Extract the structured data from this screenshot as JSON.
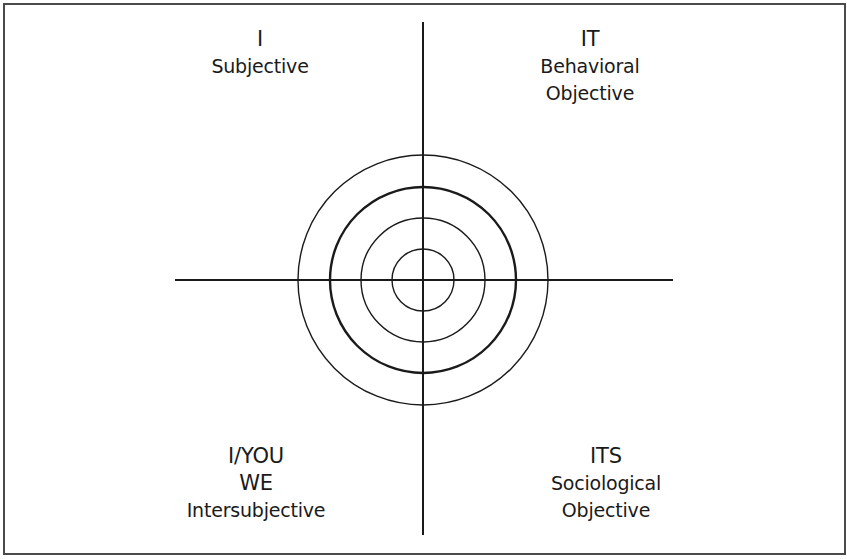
{
  "diagram": {
    "title": "",
    "quadrants": {
      "upper_left": {
        "head": "I",
        "lines": [
          "Subjective"
        ]
      },
      "upper_right": {
        "head": "IT",
        "lines": [
          "Behavioral",
          "Objective"
        ]
      },
      "lower_left": {
        "head": "I/YOU",
        "lines": [
          "WE",
          "Intersubjective"
        ]
      },
      "lower_right": {
        "head": "ITS",
        "lines": [
          "Sociological",
          "Objective"
        ]
      }
    },
    "center": {
      "x": 423,
      "y": 280
    },
    "circles": [
      {
        "r": 31,
        "stroke_width": 1.4
      },
      {
        "r": 62,
        "stroke_width": 1.4
      },
      {
        "r": 93,
        "stroke_width": 2.4
      },
      {
        "r": 125,
        "stroke_width": 1.4
      }
    ],
    "axes": {
      "horizontal": {
        "x1": 175,
        "x2": 673,
        "y": 280
      },
      "vertical": {
        "y1": 22,
        "y2": 535,
        "x": 423
      }
    },
    "colors": {
      "line": "#1a1a1a",
      "border": "#4a4a4a",
      "background": "#ffffff"
    }
  }
}
